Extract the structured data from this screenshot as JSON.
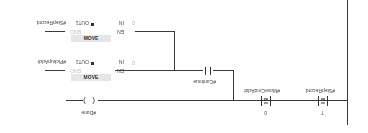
{
  "network": {
    "orientation": "rotated-180",
    "comparators": [
      {
        "operand": "#StepRecord",
        "operator": "==",
        "type": "Int",
        "value": "7"
      },
      {
        "operand": "#MoveCmdAddr",
        "operator": "==",
        "type": "Int",
        "value": "0"
      }
    ],
    "contact": {
      "operand": "#Continue"
    },
    "coil": {
      "operand": "#Done"
    },
    "moves": [
      {
        "title": "MOVE",
        "en": "EN",
        "eno": "ENO",
        "in_label": "IN",
        "in_value": "0",
        "out_label": "OUT1",
        "out_operand": "#PickupAddr"
      },
      {
        "title": "MOVE",
        "en": "EN",
        "eno": "ENO",
        "in_label": "IN",
        "in_value": "0",
        "out_label": "OUT1",
        "out_operand": "#StepRecord"
      }
    ]
  },
  "colors": {
    "wire": "#3a3a3a",
    "box_header": "#e6e6e6",
    "text": "#444444"
  }
}
